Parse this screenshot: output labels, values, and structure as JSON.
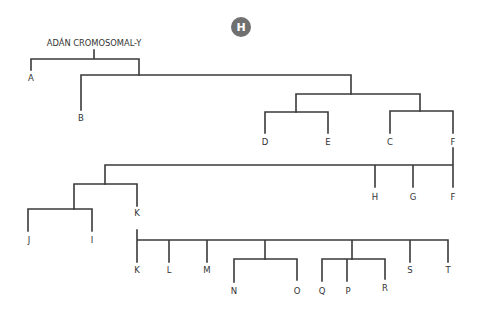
{
  "badge": {
    "letter": "H",
    "color": "#707070"
  },
  "root": {
    "label": "ADÁN CROMOSOMAL-Y"
  },
  "colors": {
    "line": "#3a3a3a",
    "text": "#333333"
  },
  "tree1": {
    "A": "A",
    "B": "B",
    "D": "D",
    "E": "E",
    "C": "C",
    "F": "F"
  },
  "tree2": {
    "root": "F",
    "H": "H",
    "G": "G",
    "F": "F",
    "J": "J",
    "I": "I",
    "K": "K"
  },
  "tree3": {
    "K": "K",
    "L": "L",
    "M": "M",
    "N": "N",
    "O": "O",
    "Q": "Q",
    "P": "P",
    "R": "R",
    "S": "S",
    "T": "T"
  }
}
